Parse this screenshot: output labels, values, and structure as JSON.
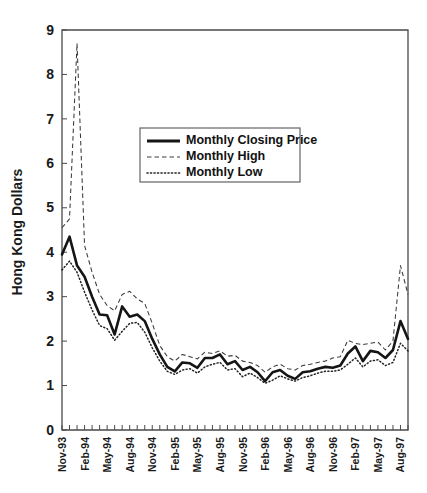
{
  "figure": {
    "background_color": "#ffffff",
    "width": 427,
    "height": 493,
    "caption_top": "",
    "caption_bottom": ""
  },
  "axes": {
    "ylabel": "Hong Kong Dollars",
    "y_ticks": [
      "0",
      "1",
      "2",
      "3",
      "4",
      "5",
      "6",
      "7",
      "8",
      "9"
    ],
    "x_ticks_labeled": [
      "Nov-93",
      "Feb-94",
      "May-94",
      "Aug-94",
      "Nov-94",
      "Feb-95",
      "May-95",
      "Aug-95",
      "Nov-95",
      "Feb-96",
      "May-96",
      "Aug-96",
      "Nov-96",
      "Feb-97",
      "May-97",
      "Aug-97"
    ],
    "grid": false,
    "frame": "full-box"
  },
  "legend": {
    "position": "upper-center-left",
    "entries": [
      {
        "label": "Monthly Closing Price",
        "style": "solid-thick",
        "color": "#151515"
      },
      {
        "label": "Monthly High",
        "style": "dashed",
        "color": "#3a3a3a"
      },
      {
        "label": "Monthly Low",
        "style": "dotted",
        "color": "#222222"
      }
    ]
  },
  "chart_data": {
    "type": "line",
    "title": "",
    "xlabel": "",
    "ylabel": "Hong Kong Dollars",
    "ylim": [
      0,
      9
    ],
    "grid": false,
    "legend_position": "upper-center-left",
    "x": [
      "Nov-93",
      "Dec-93",
      "Jan-94",
      "Feb-94",
      "Mar-94",
      "Apr-94",
      "May-94",
      "Jun-94",
      "Jul-94",
      "Aug-94",
      "Sep-94",
      "Oct-94",
      "Nov-94",
      "Dec-94",
      "Jan-95",
      "Feb-95",
      "Mar-95",
      "Apr-95",
      "May-95",
      "Jun-95",
      "Jul-95",
      "Aug-95",
      "Sep-95",
      "Oct-95",
      "Nov-95",
      "Dec-95",
      "Jan-96",
      "Feb-96",
      "Mar-96",
      "Apr-96",
      "May-96",
      "Jun-96",
      "Jul-96",
      "Aug-96",
      "Sep-96",
      "Oct-96",
      "Nov-96",
      "Dec-96",
      "Jan-97",
      "Feb-97",
      "Mar-97",
      "Apr-97",
      "May-97",
      "Jun-97",
      "Jul-97",
      "Aug-97",
      "Sep-97"
    ],
    "series": [
      {
        "name": "Monthly Closing Price",
        "style": "solid-thick",
        "color": "#151515",
        "values": [
          3.95,
          4.35,
          3.7,
          3.45,
          3.0,
          2.6,
          2.58,
          2.15,
          2.78,
          2.55,
          2.6,
          2.45,
          2.05,
          1.7,
          1.42,
          1.32,
          1.52,
          1.5,
          1.4,
          1.62,
          1.62,
          1.7,
          1.48,
          1.55,
          1.35,
          1.42,
          1.3,
          1.1,
          1.3,
          1.35,
          1.22,
          1.15,
          1.3,
          1.32,
          1.38,
          1.42,
          1.4,
          1.45,
          1.72,
          1.88,
          1.55,
          1.78,
          1.75,
          1.62,
          1.8,
          2.45,
          2.05
        ]
      },
      {
        "name": "Monthly High",
        "style": "dashed",
        "color": "#3a3a3a",
        "values": [
          4.55,
          4.75,
          8.7,
          4.15,
          3.55,
          3.05,
          2.8,
          2.68,
          3.05,
          3.12,
          2.95,
          2.85,
          2.4,
          1.9,
          1.65,
          1.55,
          1.7,
          1.65,
          1.6,
          1.75,
          1.72,
          1.78,
          1.66,
          1.68,
          1.55,
          1.52,
          1.45,
          1.3,
          1.42,
          1.48,
          1.38,
          1.35,
          1.45,
          1.48,
          1.52,
          1.55,
          1.62,
          1.65,
          2.02,
          1.95,
          1.92,
          1.95,
          1.98,
          1.8,
          2.0,
          3.7,
          3.05
        ]
      },
      {
        "name": "Monthly Low",
        "style": "dotted",
        "color": "#222222",
        "values": [
          3.6,
          3.8,
          3.55,
          3.1,
          2.7,
          2.35,
          2.28,
          2.02,
          2.22,
          2.4,
          2.42,
          2.2,
          1.85,
          1.55,
          1.32,
          1.25,
          1.35,
          1.38,
          1.28,
          1.42,
          1.48,
          1.52,
          1.35,
          1.38,
          1.2,
          1.28,
          1.18,
          1.05,
          1.12,
          1.22,
          1.15,
          1.1,
          1.18,
          1.22,
          1.28,
          1.32,
          1.32,
          1.35,
          1.48,
          1.62,
          1.42,
          1.55,
          1.58,
          1.45,
          1.52,
          1.95,
          1.78
        ]
      }
    ]
  }
}
